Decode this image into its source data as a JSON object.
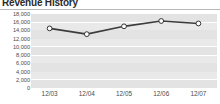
{
  "title": "Revenue History",
  "colors": {
    "plot_background": "#e9e9e9",
    "band": "#e3e3e3",
    "gridline": "#ffffff",
    "line": "#3c3c3c",
    "marker_fill": "#ffffff",
    "marker_stroke": "#333333",
    "title_text": "#2b2b2b",
    "rule": "#b8b8b8"
  },
  "chart_data": {
    "type": "line",
    "title": "Revenue History",
    "xlabel": "",
    "ylabel": "",
    "categories": [
      "12/03",
      "12/04",
      "12/05",
      "12/06",
      "12/07"
    ],
    "values": [
      14500,
      13100,
      15000,
      16300,
      15700
    ],
    "series": [
      {
        "name": "Revenue",
        "values": [
          14500,
          13100,
          15000,
          16300,
          15700
        ]
      }
    ],
    "ylim": [
      0,
      18000
    ],
    "ytick_values": [
      0,
      2000,
      4000,
      6000,
      8000,
      10000,
      12000,
      14000,
      16000,
      18000
    ],
    "ytick_labels": [
      "0",
      "2,000",
      "4,000",
      "6,000",
      "8,000",
      "10,000",
      "12,000",
      "14,000",
      "16,000",
      "18,000"
    ],
    "xtick_labels": [
      "12/03",
      "12/04",
      "12/05",
      "12/06",
      "12/07"
    ],
    "grid": true,
    "grid_orientation": "horizontal",
    "legend": false,
    "legend_position": "none",
    "markers": "circle"
  }
}
